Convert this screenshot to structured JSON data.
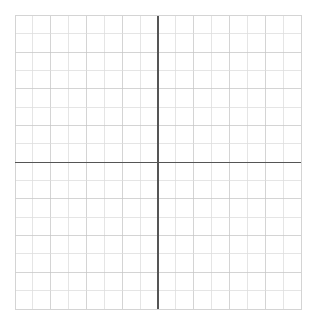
{
  "figure": {
    "title": "",
    "background_color": "#ffffff",
    "canvas_width": 315,
    "canvas_height": 324
  },
  "chart_data": {
    "type": "scatter",
    "title": "",
    "subtitle": "",
    "xlabel": "",
    "ylabel": "",
    "series": [
      {
        "name": "",
        "x": [],
        "y": []
      }
    ],
    "xlim": [
      -8,
      8
    ],
    "ylim": [
      -8,
      8
    ],
    "x_tick_labels": [],
    "y_tick_labels": [],
    "xticks": [
      -8,
      -7,
      -6,
      -5,
      -4,
      -3,
      -2,
      -1,
      0,
      1,
      2,
      3,
      4,
      5,
      6,
      7,
      8
    ],
    "yticks": [
      -8,
      -7,
      -6,
      -5,
      -4,
      -3,
      -2,
      -1,
      0,
      1,
      2,
      3,
      4,
      5,
      6,
      7,
      8
    ],
    "grid": true,
    "grid_columns": 16,
    "grid_rows": 16,
    "legend": null,
    "legend_position": "none",
    "annotations": [],
    "axes_shown": [
      "x-axis",
      "y-axis"
    ],
    "origin_x": 0,
    "origin_y": 0
  },
  "geometry": {
    "plot_left": 15,
    "plot_top": 15.5,
    "plot_right": 301,
    "plot_bottom": 309,
    "cell_size": 17.875,
    "origin_px_x": 158,
    "origin_px_y": 162.25,
    "axis_line_width": 1.2,
    "grid_line_width": 0.75,
    "border_line_width": 0.9
  },
  "colors": {
    "background": "#ffffff",
    "grid_minor": "#dcdcdc",
    "grid_major": "#c6c6c6",
    "axis": "#555555",
    "border": "#cfcfcf"
  },
  "labels": {
    "x_axis_name": "x-axis",
    "y_axis_name": "y-axis",
    "plot_area_name": "cartesian-grid",
    "origin_name": "origin"
  }
}
